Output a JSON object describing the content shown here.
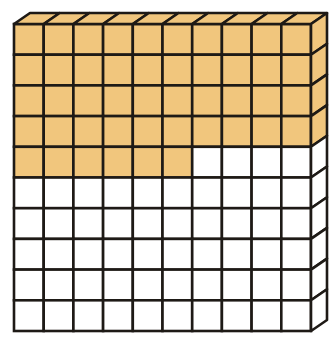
{
  "diagram": {
    "type": "base-ten-flat",
    "description": "10 by 10 flat of unit cubes with some cubes shaded",
    "rows": 10,
    "cols": 10,
    "shaded_count": 46,
    "unshaded_count": 54,
    "shaded_full_rows": 4,
    "shaded_partial_row_cells": 6,
    "colors": {
      "shaded": "#f1c67d",
      "unshaded": "#ffffff",
      "line": "#1e1a16"
    }
  }
}
